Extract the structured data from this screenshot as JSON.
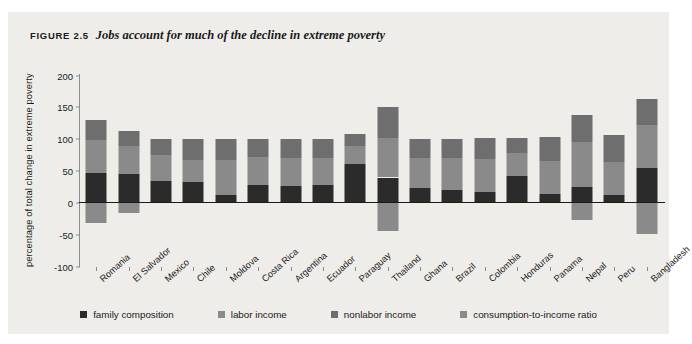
{
  "figure": {
    "number": "FIGURE 2.5",
    "title": "Jobs account for much of the decline in extreme poverty"
  },
  "axes": {
    "ylabel": "percentage of total change in extreme poverty",
    "yticks": [
      "200",
      "150",
      "100",
      "50",
      "0",
      "-50",
      "-100"
    ]
  },
  "legend": {
    "items": [
      {
        "label": "family composition",
        "color": "#2b2b2b"
      },
      {
        "label": "labor income",
        "color": "#8a8a8a"
      },
      {
        "label": "nonlabor income",
        "color": "#6e6e6e"
      },
      {
        "label": "consumption-to-income ratio",
        "color": "#8a8a8a"
      }
    ]
  },
  "chart_data": {
    "type": "bar",
    "subtype": "stacked-bar-with-negatives",
    "title": "Jobs account for much of the decline in extreme poverty",
    "xlabel": "",
    "ylabel": "percentage of total change in extreme poverty",
    "ylim": [
      -100,
      200
    ],
    "ytick_step": 50,
    "grid": false,
    "legend_position": "bottom",
    "categories": [
      "Romania",
      "El Salvador",
      "Mexico",
      "Chile",
      "Moldova",
      "Costa Rica",
      "Argentina",
      "Ecuador",
      "Paraguay",
      "Thailand",
      "Ghana",
      "Brazil",
      "Colombia",
      "Honduras",
      "Panama",
      "Nepal",
      "Peru",
      "Bangladesh"
    ],
    "series": [
      {
        "name": "family composition",
        "color": "#2b2b2b",
        "values": [
          46,
          45,
          33,
          32,
          11,
          28,
          26,
          27,
          60,
          39,
          23,
          19,
          16,
          41,
          13,
          24,
          12,
          54
        ]
      },
      {
        "name": "labor income",
        "color": "#8a8a8a",
        "values": [
          52,
          44,
          42,
          35,
          56,
          43,
          44,
          43,
          28,
          62,
          46,
          50,
          52,
          36,
          52,
          70,
          52,
          68
        ]
      },
      {
        "name": "nonlabor income",
        "color": "#6e6e6e",
        "values": [
          32,
          23,
          25,
          33,
          33,
          29,
          30,
          30,
          20,
          49,
          31,
          31,
          33,
          24,
          38,
          43,
          41,
          41
        ]
      },
      {
        "name": "consumption-to-income ratio",
        "color": "#8a8a8a",
        "values": [
          -32,
          -17,
          0,
          0,
          0,
          0,
          0,
          0,
          0,
          -45,
          0,
          0,
          0,
          0,
          0,
          -28,
          0,
          -49
        ]
      }
    ],
    "totals_positive": [
      130,
      112,
      100,
      100,
      100,
      100,
      100,
      100,
      108,
      150,
      100,
      100,
      101,
      101,
      103,
      137,
      105,
      163
    ]
  }
}
